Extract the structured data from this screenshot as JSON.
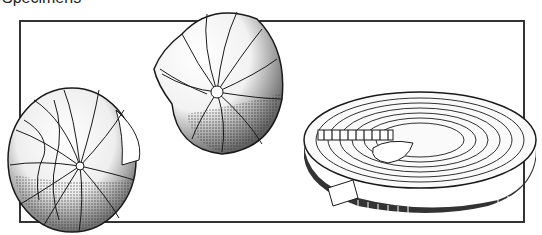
{
  "caption": {
    "text": "Specimens"
  },
  "figures": [
    {
      "id": "shell-left",
      "label": "Foraminifera shell, lateral view"
    },
    {
      "id": "shell-center",
      "label": "Foraminifera shell, umbilical view"
    },
    {
      "id": "disc-right",
      "label": "Discoidal shell, sectioned oblique view"
    }
  ],
  "colors": {
    "ink": "#1a1a1a",
    "frame": "#333333",
    "background": "#ffffff"
  }
}
